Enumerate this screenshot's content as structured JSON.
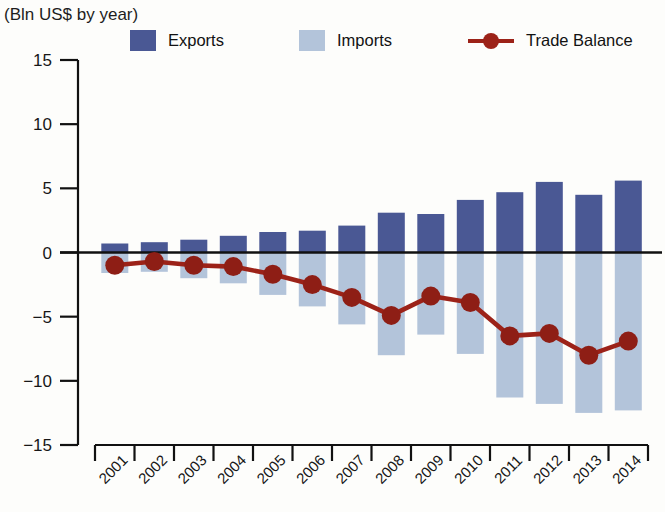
{
  "header": {
    "title": "",
    "subtitle": "(Bln US$ by year)"
  },
  "legend": {
    "items": [
      {
        "name": "exports",
        "label": "Exports",
        "color": "#4a5894",
        "marker": "square"
      },
      {
        "name": "imports",
        "label": "Imports",
        "color": "#b3c4da",
        "marker": "square"
      },
      {
        "name": "trade-balance",
        "label": "Trade Balance",
        "color": "#9c2218",
        "marker": "line-dot"
      }
    ]
  },
  "chart_data": {
    "type": "bar",
    "title": "",
    "subtitle": "(Bln US$ by year)",
    "xlabel": "",
    "ylabel": "",
    "yunit": "Bln US$",
    "ylim": [
      -15,
      15
    ],
    "yticks": [
      15,
      10,
      5,
      0,
      -5,
      -10,
      -15
    ],
    "ytick_labels": [
      "15",
      "10",
      "5",
      "0",
      "−5",
      "−10",
      "−15"
    ],
    "grid": false,
    "legend_position": "top",
    "categories": [
      "2001",
      "2002",
      "2003",
      "2004",
      "2005",
      "2006",
      "2007",
      "2008",
      "2009",
      "2010",
      "2011",
      "2012",
      "2013",
      "2014"
    ],
    "series": [
      {
        "name": "Exports",
        "type": "bar",
        "color": "#4a5894",
        "values": [
          0.7,
          0.8,
          1.0,
          1.3,
          1.6,
          1.7,
          2.1,
          3.1,
          3.0,
          4.1,
          4.7,
          5.5,
          4.5,
          5.6
        ]
      },
      {
        "name": "Imports",
        "type": "bar",
        "color": "#b3c4da",
        "plotted_as_negative": true,
        "values": [
          -1.6,
          -1.5,
          -2.0,
          -2.4,
          -3.3,
          -4.2,
          -5.6,
          -8.0,
          -6.4,
          -7.9,
          -11.3,
          -11.8,
          -12.5,
          -12.3
        ]
      },
      {
        "name": "Trade Balance",
        "type": "line",
        "color": "#9c2218",
        "values": [
          -1.0,
          -0.7,
          -1.0,
          -1.1,
          -1.7,
          -2.5,
          -3.5,
          -4.9,
          -3.4,
          -3.9,
          -6.5,
          -6.3,
          -8.0,
          -6.9
        ]
      }
    ]
  }
}
